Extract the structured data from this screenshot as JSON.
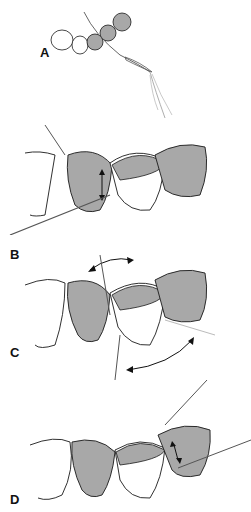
{
  "figure": {
    "colors": {
      "line": "#1a1a1a",
      "tooth_shaded": "#a8a8a8",
      "tooth_white": "#ffffff",
      "floss": "#555555",
      "floss_light": "#bbbbbb"
    },
    "panels": [
      {
        "label": "A",
        "description": "Floss threader loop passing floss under bridge (occlusal view)"
      },
      {
        "label": "B",
        "description": "Floss threaded under bridge; up-down motion against abutment"
      },
      {
        "label": "C",
        "description": "Floss moved side to side beneath pontic"
      },
      {
        "label": "D",
        "description": "Floss cleaning distal abutment with up-down motion"
      }
    ]
  }
}
